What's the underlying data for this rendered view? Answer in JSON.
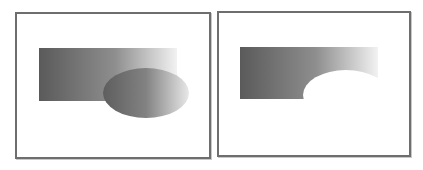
{
  "figure": {
    "panels": [
      {
        "id": "union-overlap",
        "caption": "",
        "rect": {
          "x": 39,
          "y": 48,
          "w": 138,
          "h": 53,
          "gradient": [
            "#5a5a5a",
            "#9a9a9a",
            "#f4f4f4"
          ]
        },
        "ellipse": {
          "cx": 146,
          "cy": 93,
          "rx": 43,
          "ry": 25,
          "gradient": [
            "#5c5c5c",
            "#8c8c8c",
            "#e6e6e6"
          ]
        }
      },
      {
        "id": "subtract",
        "caption": "",
        "rect": {
          "x": 240,
          "y": 47,
          "w": 138,
          "h": 52,
          "gradient": [
            "#5a5a5a",
            "#9a9a9a",
            "#f4f4f4"
          ]
        },
        "cutout": {
          "cx": 346,
          "cy": 95,
          "rx": 43,
          "ry": 25
        }
      }
    ],
    "colors": {
      "border": "#6e6e6e",
      "background": "#ffffff"
    }
  }
}
